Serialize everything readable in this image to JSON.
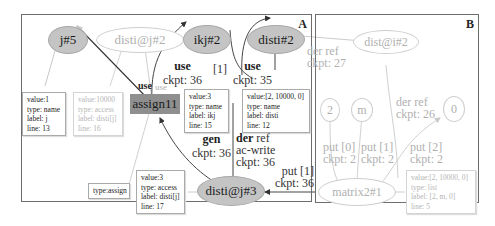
{
  "panels": {
    "a": {
      "label": "A"
    },
    "b": {
      "label": "B"
    }
  },
  "nodes": {
    "j5": "j#5",
    "disti_j2": "disti@j#2",
    "ikj2": "ikj#2",
    "disti2": "disti#2",
    "assign11": "assign11",
    "disti_j3": "disti@j#3",
    "dist_i2": "dist@i#2",
    "n2": "2",
    "nm": "m",
    "n0": "0",
    "matrix2": "matrix2#1"
  },
  "info_boxes": {
    "j5": {
      "value": "value:1",
      "type": "type:  name",
      "label": "label: j",
      "line": "line:   13"
    },
    "disti_j2": {
      "value": "value:10000",
      "type": "type:  access",
      "label": "label: disti[j]",
      "line": "line:   16"
    },
    "ikj2": {
      "value": "value:3",
      "type": "type:  name",
      "label": "label: ikj",
      "line": "line:   15"
    },
    "disti2": {
      "value": "value:[2, 10000, 0]",
      "type": "type:  name",
      "label": "label: disti",
      "line": "line:   12"
    },
    "assign": {
      "type": "type:assign"
    },
    "disti_j3": {
      "value": "value:3",
      "type": "type:  access",
      "label": "label: disti[j]",
      "line": "line:   17"
    },
    "matrix2": {
      "value": "value:[2, 10000, 0]",
      "type": "type:  list",
      "label": "label: [2, m, 0]",
      "line": "line:   5"
    }
  },
  "edge_labels": {
    "use_j5": "use",
    "use_faded": "use",
    "use_ikj_top": "use",
    "use_ikj_ckpt": "ckpt: 36",
    "bracket1": "[1]",
    "use_disti_top": "use",
    "use_disti_ckpt": "ckpt: 35",
    "gen_top": "gen",
    "gen_ckpt": "ckpt: 36",
    "derref_der": "der",
    "derref_ref": "ref",
    "derref_acwrite": "ac-write",
    "derref_ckpt": "ckpt: 36",
    "put1_top": "put [1]",
    "put1_ckpt": "ckpt: 36",
    "derref27_top": "der ref",
    "derref27_ckpt": "ckpt: 27",
    "derref26_top": "der ref",
    "derref26_ckpt": "ckpt: 26",
    "put0_top": "put [0]",
    "put0_ckpt": "ckpt: 2",
    "putb1_top": "put [1]",
    "putb1_ckpt": "ckpt: 2",
    "put2_top": "put [2]",
    "put2_ckpt": "ckpt: 2"
  },
  "colors": {
    "dark_node": "#c4c4c4",
    "assign_rect": "#8f8f8f",
    "faded": "#b0b0b0",
    "edge": "#444444",
    "faded_edge": "#cccccc"
  }
}
